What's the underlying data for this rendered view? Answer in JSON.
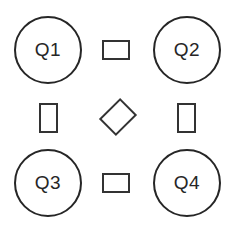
{
  "diagram": {
    "nodes": [
      {
        "id": "q1",
        "label": "Q1",
        "shape": "circle"
      },
      {
        "id": "q2",
        "label": "Q2",
        "shape": "circle"
      },
      {
        "id": "q3",
        "label": "Q3",
        "shape": "circle"
      },
      {
        "id": "q4",
        "label": "Q4",
        "shape": "circle"
      }
    ],
    "connectors": [
      {
        "id": "top",
        "between": [
          "Q1",
          "Q2"
        ],
        "shape": "rectangle-horizontal"
      },
      {
        "id": "left",
        "between": [
          "Q1",
          "Q3"
        ],
        "shape": "rectangle-vertical"
      },
      {
        "id": "right",
        "between": [
          "Q2",
          "Q4"
        ],
        "shape": "rectangle-vertical"
      },
      {
        "id": "bottom",
        "between": [
          "Q3",
          "Q4"
        ],
        "shape": "rectangle-horizontal"
      },
      {
        "id": "center",
        "between": [
          "Q1",
          "Q4",
          "Q2",
          "Q3"
        ],
        "shape": "rectangle-rotated-45"
      }
    ],
    "colors": {
      "stroke": "#262626",
      "background": "#ffffff"
    }
  }
}
